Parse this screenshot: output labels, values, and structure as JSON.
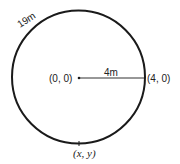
{
  "diagram": {
    "arc_label": "19m",
    "center_label": "(0, 0)",
    "radius_label": "4m",
    "edge_point_label": "(4, 0)",
    "moving_point_label": "(x, y)",
    "colors": {
      "stroke": "#1a1a1a",
      "background": "#ffffff"
    }
  }
}
